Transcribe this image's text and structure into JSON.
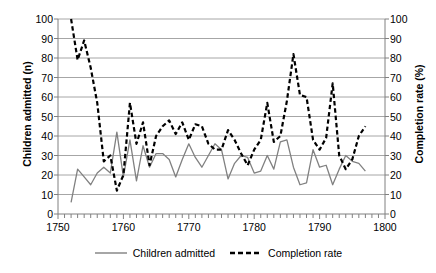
{
  "chart_data": {
    "type": "line",
    "title": "",
    "subtitle": "",
    "xlabel": "",
    "ylabel": "Children admitted (n)",
    "y2label": "Completion rate (%)",
    "xlim": [
      1750,
      1800
    ],
    "ylim": [
      0,
      100
    ],
    "y2lim": [
      0,
      100
    ],
    "xticks": [
      1750,
      1760,
      1770,
      1780,
      1790,
      1800
    ],
    "yticks": [
      0,
      10,
      20,
      30,
      40,
      50,
      60,
      70,
      80,
      90,
      100
    ],
    "y2ticks": [
      0,
      10,
      20,
      30,
      40,
      50,
      60,
      70,
      80,
      90,
      100
    ],
    "minor_xtick_interval": 1,
    "grid": "horizontal",
    "legend_position": "bottom-center",
    "colors": {
      "children_admitted": "#808080",
      "completion_rate": "#000000",
      "gridline": "#a6a6a6",
      "axis": "#808080",
      "background": "#ffffff"
    },
    "series": [
      {
        "name": "Children admitted",
        "axis": "left",
        "style": "solid",
        "color": "#808080",
        "x": [
          1752,
          1753,
          1754,
          1755,
          1756,
          1757,
          1758,
          1759,
          1760,
          1761,
          1762,
          1763,
          1764,
          1765,
          1766,
          1767,
          1768,
          1769,
          1770,
          1771,
          1772,
          1773,
          1774,
          1775,
          1776,
          1777,
          1778,
          1779,
          1780,
          1781,
          1782,
          1783,
          1784,
          1785,
          1786,
          1787,
          1788,
          1789,
          1790,
          1791,
          1792,
          1793,
          1794,
          1795,
          1796,
          1797
        ],
        "values": [
          6,
          23,
          19,
          15,
          21,
          24,
          21,
          42,
          19,
          38,
          17,
          35,
          24,
          31,
          31,
          28,
          19,
          28,
          36,
          29,
          24,
          30,
          36,
          33,
          18,
          26,
          30,
          29,
          21,
          22,
          30,
          23,
          37,
          38,
          24,
          15,
          16,
          33,
          24,
          25,
          15,
          23,
          30,
          27,
          26,
          22
        ]
      },
      {
        "name": "Completion rate",
        "axis": "right",
        "style": "dashed",
        "color": "#000000",
        "x": [
          1752,
          1753,
          1754,
          1755,
          1756,
          1757,
          1758,
          1759,
          1760,
          1761,
          1762,
          1763,
          1764,
          1765,
          1766,
          1767,
          1768,
          1769,
          1770,
          1771,
          1772,
          1773,
          1774,
          1775,
          1776,
          1777,
          1778,
          1779,
          1780,
          1781,
          1782,
          1783,
          1784,
          1785,
          1786,
          1787,
          1788,
          1789,
          1790,
          1791,
          1792,
          1793,
          1794,
          1795,
          1796,
          1797
        ],
        "values": [
          100,
          79,
          89,
          75,
          57,
          27,
          30,
          12,
          20,
          57,
          36,
          47,
          25,
          40,
          45,
          48,
          41,
          47,
          38,
          46,
          45,
          36,
          33,
          33,
          43,
          38,
          31,
          25,
          33,
          38,
          57,
          37,
          40,
          58,
          82,
          61,
          60,
          38,
          33,
          39,
          67,
          30,
          23,
          28,
          40,
          45
        ]
      }
    ]
  },
  "legend": {
    "entries": [
      {
        "label": "Children admitted",
        "style": "solid",
        "color": "#808080"
      },
      {
        "label": "Completion rate",
        "style": "dashed",
        "color": "#000000"
      }
    ]
  }
}
